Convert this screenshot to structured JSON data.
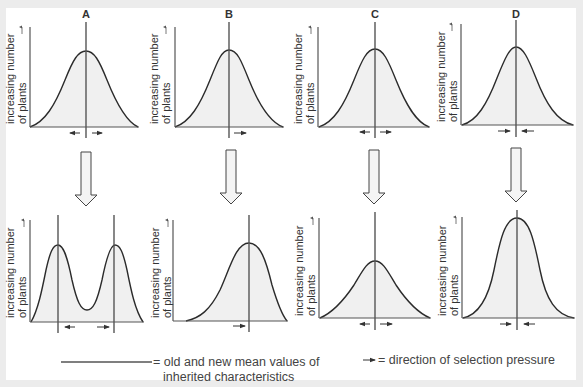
{
  "figure": {
    "panels": [
      {
        "id": "A",
        "label": "A",
        "selection": "disruptive",
        "top_arrows": "outward",
        "bottom_arrows": "outward"
      },
      {
        "id": "B",
        "label": "B",
        "selection": "directional",
        "top_arrows": "right",
        "bottom_arrows": "right"
      },
      {
        "id": "C",
        "label": "C",
        "selection": "stabilising-widening",
        "top_arrows": "outward",
        "bottom_arrows": "outward"
      },
      {
        "id": "D",
        "label": "D",
        "selection": "stabilising",
        "top_arrows": "inward",
        "bottom_arrows": "inward"
      }
    ],
    "y_axis_label_line1": "increasing number",
    "y_axis_label_line2": "of plants"
  },
  "legend": {
    "mean_line_text_1": "= old and new mean values of",
    "mean_line_text_2": "inherited characteristics",
    "arrow_text": "= direction of selection pressure"
  },
  "colors": {
    "background": "#ececec",
    "panel": "#ffffff",
    "curve": "#2b2b2b",
    "fill": "#f0f0f0",
    "axis": "#555555",
    "mean_line": "#555555"
  }
}
